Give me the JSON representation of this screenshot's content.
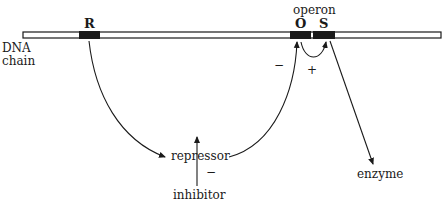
{
  "diagram": {
    "dna_label_line1": "DNA",
    "dna_label_line2": "chain",
    "gene_R": "R",
    "gene_O": "O",
    "gene_S": "S",
    "operon_label": "operon",
    "repressor_label": "repressor",
    "inhibitor_label": "inhibitor",
    "enzyme_label": "enzyme",
    "sign_minus_operator": "−",
    "sign_plus": "+",
    "sign_minus_inhibitor": "−",
    "colors": {
      "ink": "#1a1a1a",
      "background": "#ffffff"
    }
  }
}
